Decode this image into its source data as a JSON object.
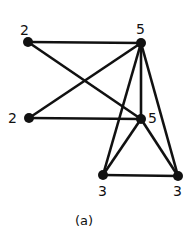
{
  "figure": {
    "caption": "(a)",
    "nodes": [
      {
        "id": "A",
        "label": "2",
        "x": 28,
        "y": 42,
        "lx": 20,
        "ly": 23
      },
      {
        "id": "B",
        "label": "5",
        "x": 141,
        "y": 43,
        "lx": 136,
        "ly": 22
      },
      {
        "id": "C",
        "label": "2",
        "x": 29,
        "y": 118,
        "lx": 8,
        "ly": 111
      },
      {
        "id": "D",
        "label": "5",
        "x": 141,
        "y": 119,
        "lx": 148,
        "ly": 111
      },
      {
        "id": "E",
        "label": "3",
        "x": 103,
        "y": 175,
        "lx": 98,
        "ly": 184
      },
      {
        "id": "F",
        "label": "3",
        "x": 178,
        "y": 176,
        "lx": 173,
        "ly": 184
      }
    ],
    "edges": [
      [
        "A",
        "B"
      ],
      [
        "A",
        "D"
      ],
      [
        "C",
        "B"
      ],
      [
        "C",
        "D"
      ],
      [
        "B",
        "D"
      ],
      [
        "B",
        "E"
      ],
      [
        "B",
        "F"
      ],
      [
        "D",
        "E"
      ],
      [
        "D",
        "F"
      ],
      [
        "E",
        "F"
      ]
    ],
    "colors": {
      "stroke": "#111111",
      "background": "#ffffff"
    }
  }
}
